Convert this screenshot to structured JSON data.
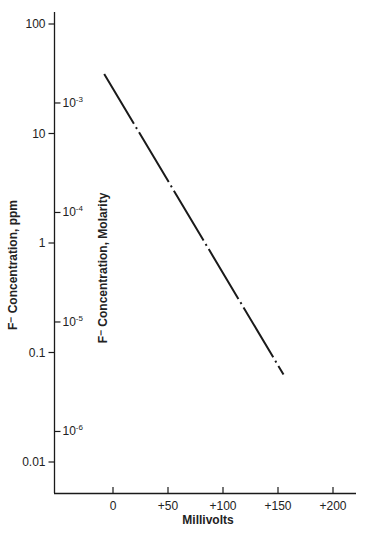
{
  "chart_data": {
    "type": "line",
    "title": "",
    "xlabel": "Millivolts",
    "ylabel": "F⁻ Concentration, ppm",
    "ylabel_right": "F⁻ Concentration, Molarity",
    "xscale": "linear",
    "yscale": "log",
    "xlim": [
      -40,
      220
    ],
    "ylim": [
      0.004,
      140
    ],
    "grid": false,
    "legend": null,
    "x_ticks": [
      {
        "value": 0,
        "label": "0"
      },
      {
        "value": 50,
        "label": "+50"
      },
      {
        "value": 100,
        "label": "+100"
      },
      {
        "value": 150,
        "label": "+150"
      },
      {
        "value": 200,
        "label": "+200"
      }
    ],
    "y_ticks_left": [
      {
        "value": 100,
        "label": "100"
      },
      {
        "value": 10,
        "label": "10"
      },
      {
        "value": 1,
        "label": "1"
      },
      {
        "value": 0.1,
        "label": "0.1"
      },
      {
        "value": 0.01,
        "label": "0.01"
      }
    ],
    "y_ticks_right": [
      {
        "base": "10",
        "exp": "-3",
        "ppm_equiv": 19
      },
      {
        "base": "10",
        "exp": "-4",
        "ppm_equiv": 1.9
      },
      {
        "base": "10",
        "exp": "-5",
        "ppm_equiv": 0.19
      },
      {
        "base": "10",
        "exp": "-6",
        "ppm_equiv": 0.019
      }
    ],
    "series": [
      {
        "name": "F⁻ electrode response",
        "style": "dash-dot",
        "color": "#1a1a1a",
        "x": [
          -8,
          155
        ],
        "y": [
          35,
          0.063
        ]
      }
    ]
  }
}
